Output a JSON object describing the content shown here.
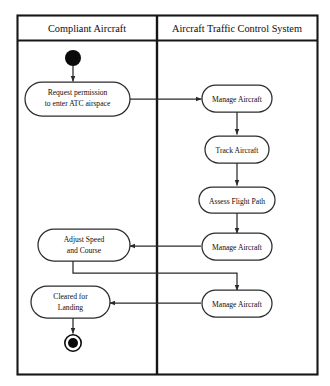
{
  "diagram": {
    "type": "uml-activity-diagram",
    "swimlanes": [
      {
        "id": "compliant-aircraft",
        "label": "Compliant Aircraft"
      },
      {
        "id": "atc-system",
        "label": "Aircraft Traffic Control System"
      }
    ],
    "nodes": [
      {
        "id": "start",
        "kind": "initial-node",
        "lane": "compliant-aircraft",
        "label": ""
      },
      {
        "id": "request",
        "kind": "action",
        "lane": "compliant-aircraft",
        "label": "Request permission to enter ATC airspace",
        "line1": "Request permission",
        "line2": "to enter ATC airspace"
      },
      {
        "id": "manage-1",
        "kind": "action",
        "lane": "atc-system",
        "label": "Manage Aircraft"
      },
      {
        "id": "track",
        "kind": "action",
        "lane": "atc-system",
        "label": "Track Aircraft"
      },
      {
        "id": "assess",
        "kind": "action",
        "lane": "atc-system",
        "label": "Assess Flight Path"
      },
      {
        "id": "manage-2",
        "kind": "action",
        "lane": "atc-system",
        "label": "Manage Aircraft"
      },
      {
        "id": "adjust",
        "kind": "action",
        "lane": "compliant-aircraft",
        "label": "Adjust Speed and Course",
        "line1": "Adjust Speed",
        "line2": "and Course"
      },
      {
        "id": "manage-3",
        "kind": "action",
        "lane": "atc-system",
        "label": "Manage Aircraft"
      },
      {
        "id": "cleared",
        "kind": "action",
        "lane": "compliant-aircraft",
        "label": "Cleared for Landing",
        "line1": "Cleared for",
        "line2": "Landing"
      },
      {
        "id": "end",
        "kind": "final-node",
        "lane": "compliant-aircraft",
        "label": ""
      }
    ],
    "edges": [
      {
        "from": "start",
        "to": "request",
        "routing": "vertical"
      },
      {
        "from": "request",
        "to": "manage-1",
        "routing": "horizontal-right-cross-lane"
      },
      {
        "from": "manage-1",
        "to": "track",
        "routing": "vertical"
      },
      {
        "from": "track",
        "to": "assess",
        "routing": "vertical"
      },
      {
        "from": "assess",
        "to": "manage-2",
        "routing": "vertical"
      },
      {
        "from": "manage-2",
        "to": "adjust",
        "routing": "horizontal-left-cross-lane"
      },
      {
        "from": "adjust",
        "to": "manage-3",
        "routing": "down-right-down-cross-lane"
      },
      {
        "from": "manage-3",
        "to": "cleared",
        "routing": "horizontal-left-cross-lane"
      },
      {
        "from": "cleared",
        "to": "end",
        "routing": "vertical"
      }
    ],
    "colors": {
      "background": "#ffffff",
      "frame_stroke": "#161616",
      "node_stroke": "#2c2c2c",
      "node_fill": "#ffffff",
      "flow_stroke": "#2a2a2a",
      "marker_fill": "#0a0a0a",
      "text": "#0d0d0d"
    }
  }
}
